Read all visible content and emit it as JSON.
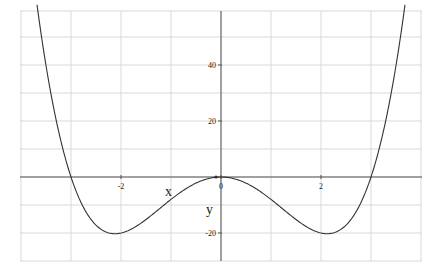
{
  "chart_data": {
    "type": "line",
    "title": "",
    "xlabel": "x",
    "ylabel": "y",
    "function": "y = x^4 - 9x^2",
    "xlim": [
      -4,
      4
    ],
    "ylim": [
      -30,
      60
    ],
    "x_ticks": [
      {
        "value": -2,
        "label": "-2"
      },
      {
        "value": 0,
        "label": "0"
      },
      {
        "value": 2,
        "label": "2"
      }
    ],
    "y_ticks": [
      {
        "value": 40,
        "label": "40"
      },
      {
        "value": 20,
        "label": "20"
      },
      {
        "value": -20,
        "label": "-20"
      }
    ],
    "grid": true,
    "legend": null,
    "series": [
      {
        "name": "y",
        "x": [
          -3.7,
          -3.5,
          -3.25,
          -3,
          -2.75,
          -2.5,
          -2.25,
          -2.12,
          -2,
          -1.75,
          -1.5,
          -1.25,
          -1,
          -0.75,
          -0.5,
          -0.25,
          0,
          0.25,
          0.5,
          0.75,
          1,
          1.25,
          1.5,
          1.75,
          2,
          2.12,
          2.25,
          2.5,
          2.75,
          3,
          3.25,
          3.5,
          3.7
        ],
        "values": [
          64.2,
          39.8,
          16.5,
          0,
          -10.9,
          -17.2,
          -19.9,
          -20.2,
          -20,
          -18.2,
          -15.2,
          -11.6,
          -8,
          -4.7,
          -2.2,
          -0.6,
          0,
          -0.6,
          -2.2,
          -4.7,
          -8,
          -11.6,
          -15.2,
          -18.2,
          -20,
          -20.2,
          -19.9,
          -17.2,
          -10.9,
          0,
          16.5,
          39.8,
          64.2
        ]
      }
    ]
  },
  "labels": {
    "x_axis": "x",
    "y_axis": "y",
    "origin": "0"
  }
}
